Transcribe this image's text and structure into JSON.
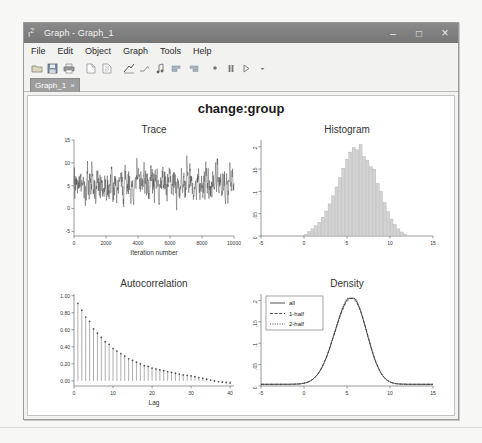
{
  "window": {
    "title": "Graph - Graph_1",
    "icon": "stata-graph-icon",
    "controls": {
      "minimize": "–",
      "maximize": "□",
      "close": "×"
    }
  },
  "menu": {
    "items": [
      "File",
      "Edit",
      "Object",
      "Graph",
      "Tools",
      "Help"
    ]
  },
  "toolbar": {
    "buttons": [
      "open-icon",
      "save-icon",
      "print-icon",
      "new-page-icon",
      "copy-page-icon",
      "graph-editor-icon",
      "add-line-icon",
      "add-marker-icon",
      "align-left-icon",
      "align-right-icon",
      "record-icon",
      "pause-icon",
      "play-icon",
      "dropdown-arrow-icon"
    ]
  },
  "tabs": {
    "items": [
      {
        "label": "Graph_1",
        "close": "×",
        "active": true
      }
    ]
  },
  "chart_data": [
    {
      "type": "line",
      "title": "Trace",
      "xlabel": "Iteration number",
      "ylabel": "",
      "xticks": [
        0,
        2000,
        4000,
        6000,
        8000,
        10000
      ],
      "xticklabels": [
        "0",
        "2000",
        "4000",
        "6000",
        "8000",
        "10000"
      ],
      "yticks": [
        -5,
        0,
        5,
        10,
        15
      ],
      "yticklabels": [
        "-5",
        "0",
        "5",
        "10",
        "15"
      ],
      "xlim": [
        0,
        10000
      ],
      "ylim": [
        -6,
        15
      ],
      "series": [
        {
          "name": "trace",
          "mean": 5.4,
          "sd": 2.2,
          "n": 1000
        }
      ],
      "grid": false
    },
    {
      "type": "bar",
      "title": "Histogram",
      "xlabel": "",
      "ylabel": "",
      "xticks": [
        -5,
        0,
        5,
        10,
        15
      ],
      "xticklabels": [
        "-5",
        "0",
        "5",
        "10",
        "15"
      ],
      "yticks": [
        0,
        0.05,
        0.1,
        0.15,
        0.2
      ],
      "yticklabels": [
        "0",
        ".05",
        ".1",
        ".15",
        ".2"
      ],
      "xlim": [
        -5,
        15
      ],
      "ylim": [
        0,
        0.215
      ],
      "bin_centers": [
        0.2,
        0.6,
        1.0,
        1.4,
        1.8,
        2.2,
        2.6,
        3.0,
        3.4,
        3.8,
        4.2,
        4.6,
        5.0,
        5.4,
        5.8,
        6.2,
        6.6,
        7.0,
        7.4,
        7.8,
        8.2,
        8.6,
        9.0,
        9.4,
        9.8,
        10.2,
        10.6,
        11.0,
        11.4,
        11.8
      ],
      "values": [
        0.004,
        0.01,
        0.016,
        0.023,
        0.031,
        0.042,
        0.056,
        0.072,
        0.09,
        0.11,
        0.131,
        0.152,
        0.172,
        0.188,
        0.198,
        0.193,
        0.205,
        0.178,
        0.17,
        0.155,
        0.15,
        0.118,
        0.1,
        0.075,
        0.055,
        0.038,
        0.026,
        0.016,
        0.009,
        0.004
      ],
      "grid": false
    },
    {
      "type": "bar",
      "title": "Autocorrelation",
      "xlabel": "Lag",
      "ylabel": "",
      "xticks": [
        0,
        10,
        20,
        30,
        40
      ],
      "xticklabels": [
        "0",
        "10",
        "20",
        "30",
        "40"
      ],
      "yticks": [
        0.0,
        0.2,
        0.4,
        0.6,
        0.8,
        1.0
      ],
      "yticklabels": [
        "0.00",
        "0.20",
        "0.40",
        "0.60",
        "0.80",
        "1.00"
      ],
      "xlim": [
        0,
        41
      ],
      "ylim": [
        -0.06,
        1.02
      ],
      "lags": [
        1,
        2,
        3,
        4,
        5,
        6,
        7,
        8,
        9,
        10,
        11,
        12,
        13,
        14,
        15,
        16,
        17,
        18,
        19,
        20,
        21,
        22,
        23,
        24,
        25,
        26,
        27,
        28,
        29,
        30,
        31,
        32,
        33,
        34,
        35,
        36,
        37,
        38,
        39,
        40
      ],
      "values": [
        0.91,
        0.83,
        0.75,
        0.7,
        0.61,
        0.56,
        0.51,
        0.46,
        0.43,
        0.38,
        0.35,
        0.32,
        0.29,
        0.26,
        0.24,
        0.22,
        0.2,
        0.18,
        0.17,
        0.15,
        0.14,
        0.13,
        0.12,
        0.11,
        0.1,
        0.09,
        0.08,
        0.07,
        0.065,
        0.06,
        0.05,
        0.04,
        0.03,
        0.02,
        0.01,
        0.0,
        -0.01,
        -0.015,
        -0.02,
        -0.025
      ],
      "grid": false
    },
    {
      "type": "line",
      "title": "Density",
      "xlabel": "",
      "ylabel": "",
      "xticks": [
        -5,
        0,
        5,
        10,
        15
      ],
      "xticklabels": [
        "-5",
        "0",
        "5",
        "10",
        "15"
      ],
      "yticks": [
        0,
        0.05,
        0.1,
        0.15,
        0.2
      ],
      "yticklabels": [
        "0",
        ".05",
        ".1",
        ".15",
        ".2"
      ],
      "xlim": [
        -5,
        15
      ],
      "ylim": [
        0,
        0.215
      ],
      "legend_position": "top-left",
      "series": [
        {
          "name": "all",
          "style": "solid"
        },
        {
          "name": "1-half",
          "style": "dashed"
        },
        {
          "name": "2-half",
          "style": "dotted"
        }
      ],
      "grid": false
    }
  ],
  "graph": {
    "title": "change:group"
  }
}
